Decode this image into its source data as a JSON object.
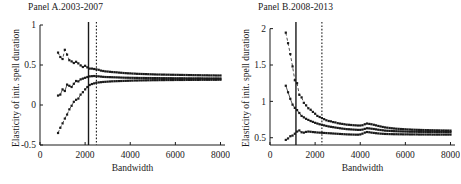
{
  "figure": {
    "background": "#ffffff",
    "ink_color": "#1a1a1a",
    "width": 461,
    "height": 184
  },
  "panels": [
    {
      "id": "panel-a",
      "title": "Panel A.2003-2007",
      "xlabel": "Bandwidth",
      "ylabel": "Elasticity of init. spell duration"
    },
    {
      "id": "panel-b",
      "title": "Panel B.2008-2013",
      "xlabel": "Bandwidth",
      "ylabel": "Elasticity of init. spell duration"
    }
  ],
  "chart_data": [
    {
      "type": "line",
      "title": "Panel A.2003-2007",
      "xlabel": "Bandwidth",
      "ylabel": "Elasticity of init. spell duration",
      "xlim": [
        0,
        8200
      ],
      "ylim": [
        -0.5,
        1.0
      ],
      "xticks": [
        0,
        2000,
        4000,
        6000,
        8000
      ],
      "xticklabels": [
        "0",
        "2000",
        "4000",
        "6000",
        "8000"
      ],
      "yticks": [
        -0.5,
        0,
        0.5,
        1
      ],
      "yticklabels": [
        "-0.5",
        "0",
        "0.5",
        "1"
      ],
      "grid": false,
      "legend": null,
      "marker": "square",
      "vlines": [
        {
          "x": 2150,
          "style": "solid",
          "label": "optimal bandwidth"
        },
        {
          "x": 2500,
          "style": "dotted",
          "label": "alternative bandwidth"
        }
      ],
      "x": [
        800,
        900,
        1000,
        1100,
        1200,
        1300,
        1400,
        1500,
        1600,
        1700,
        1800,
        1900,
        2000,
        2100,
        2200,
        2300,
        2400,
        2500,
        2600,
        2700,
        2800,
        2900,
        3000,
        3100,
        3200,
        3300,
        3400,
        3500,
        3600,
        3700,
        3800,
        3900,
        4000,
        4100,
        4200,
        4300,
        4400,
        4500,
        4600,
        4700,
        4800,
        4900,
        5000,
        5100,
        5200,
        5300,
        5400,
        5500,
        5600,
        5700,
        5800,
        5900,
        6000,
        6100,
        6200,
        6300,
        6400,
        6500,
        6600,
        6700,
        6800,
        6900,
        7000,
        7100,
        7200,
        7300,
        7400,
        7500,
        7600,
        7700,
        7800,
        7900,
        8000
      ],
      "series": [
        {
          "name": "upper confidence bound",
          "style": "dashed",
          "values": [
            0.655,
            0.6,
            0.575,
            0.69,
            0.63,
            0.56,
            0.545,
            0.525,
            0.54,
            0.52,
            0.495,
            0.475,
            0.49,
            0.47,
            0.455,
            0.455,
            0.45,
            0.445,
            0.44,
            0.43,
            0.425,
            0.42,
            0.418,
            0.415,
            0.412,
            0.41,
            0.408,
            0.405,
            0.403,
            0.4,
            0.398,
            0.396,
            0.395,
            0.393,
            0.392,
            0.39,
            0.389,
            0.388,
            0.387,
            0.386,
            0.385,
            0.384,
            0.383,
            0.382,
            0.381,
            0.381,
            0.38,
            0.38,
            0.379,
            0.379,
            0.378,
            0.378,
            0.377,
            0.377,
            0.376,
            0.376,
            0.375,
            0.375,
            0.374,
            0.374,
            0.373,
            0.373,
            0.372,
            0.372,
            0.371,
            0.371,
            0.371,
            0.37,
            0.37,
            0.37,
            0.369,
            0.369,
            0.369
          ]
        },
        {
          "name": "point estimate",
          "style": "solid",
          "values": [
            0.118,
            0.13,
            0.195,
            0.175,
            0.255,
            0.24,
            0.225,
            0.265,
            0.3,
            0.295,
            0.32,
            0.33,
            0.34,
            0.35,
            0.358,
            0.36,
            0.362,
            0.36,
            0.358,
            0.355,
            0.352,
            0.35,
            0.349,
            0.348,
            0.347,
            0.346,
            0.345,
            0.344,
            0.343,
            0.342,
            0.341,
            0.341,
            0.34,
            0.34,
            0.339,
            0.339,
            0.338,
            0.338,
            0.338,
            0.337,
            0.337,
            0.337,
            0.336,
            0.336,
            0.336,
            0.336,
            0.335,
            0.335,
            0.335,
            0.335,
            0.335,
            0.334,
            0.334,
            0.334,
            0.334,
            0.334,
            0.334,
            0.333,
            0.333,
            0.333,
            0.333,
            0.333,
            0.333,
            0.333,
            0.333,
            0.332,
            0.332,
            0.332,
            0.332,
            0.332,
            0.332,
            0.332,
            0.332
          ]
        },
        {
          "name": "lower confidence bound",
          "style": "dashed",
          "values": [
            -0.35,
            -0.285,
            -0.23,
            -0.17,
            -0.12,
            -0.055,
            -0.01,
            0.04,
            0.065,
            0.08,
            0.13,
            0.16,
            0.195,
            0.225,
            0.25,
            0.262,
            0.27,
            0.278,
            0.282,
            0.285,
            0.288,
            0.29,
            0.292,
            0.294,
            0.296,
            0.297,
            0.298,
            0.299,
            0.3,
            0.301,
            0.302,
            0.303,
            0.304,
            0.305,
            0.306,
            0.306,
            0.307,
            0.307,
            0.308,
            0.308,
            0.309,
            0.309,
            0.31,
            0.31,
            0.31,
            0.311,
            0.311,
            0.311,
            0.312,
            0.312,
            0.312,
            0.312,
            0.313,
            0.313,
            0.313,
            0.313,
            0.313,
            0.314,
            0.314,
            0.314,
            0.314,
            0.314,
            0.314,
            0.315,
            0.315,
            0.315,
            0.315,
            0.315,
            0.315,
            0.315,
            0.315,
            0.316,
            0.316
          ]
        }
      ]
    },
    {
      "type": "line",
      "title": "Panel B.2008-2013",
      "xlabel": "Bandwidth",
      "ylabel": "Elasticity of init. spell duration",
      "xlim": [
        0,
        8200
      ],
      "ylim": [
        0.4,
        2.05
      ],
      "xticks": [
        0,
        2000,
        4000,
        6000,
        8000
      ],
      "xticklabels": [
        "0",
        "2000",
        "4000",
        "6000",
        "8000"
      ],
      "yticks": [
        0.5,
        1,
        1.5,
        2
      ],
      "yticklabels": [
        "0.5",
        "1",
        "1.5",
        "2"
      ],
      "grid": false,
      "legend": null,
      "marker": "square",
      "vlines": [
        {
          "x": 1150,
          "style": "solid",
          "label": "optimal bandwidth"
        },
        {
          "x": 2300,
          "style": "dotted",
          "label": "alternative bandwidth"
        }
      ],
      "x": [
        700,
        800,
        900,
        1000,
        1100,
        1200,
        1300,
        1400,
        1500,
        1600,
        1700,
        1800,
        1900,
        2000,
        2100,
        2200,
        2300,
        2400,
        2500,
        2600,
        2700,
        2800,
        2900,
        3000,
        3100,
        3200,
        3300,
        3400,
        3500,
        3600,
        3700,
        3800,
        3900,
        4000,
        4100,
        4200,
        4300,
        4400,
        4500,
        4600,
        4700,
        4800,
        4900,
        5000,
        5100,
        5200,
        5300,
        5400,
        5500,
        5600,
        5700,
        5800,
        5900,
        6000,
        6100,
        6200,
        6300,
        6400,
        6500,
        6600,
        6700,
        6800,
        6900,
        7000,
        7100,
        7200,
        7300,
        7400,
        7500,
        7600,
        7700,
        7800,
        7900,
        8000
      ],
      "series": [
        {
          "name": "upper confidence bound",
          "style": "dashed",
          "values": [
            1.945,
            1.8,
            1.65,
            1.48,
            1.29,
            1.25,
            1.09,
            1.055,
            0.98,
            0.945,
            0.905,
            0.885,
            0.855,
            0.83,
            0.8,
            0.785,
            0.77,
            0.755,
            0.74,
            0.73,
            0.725,
            0.715,
            0.71,
            0.7,
            0.695,
            0.69,
            0.685,
            0.68,
            0.678,
            0.675,
            0.672,
            0.67,
            0.668,
            0.668,
            0.672,
            0.685,
            0.695,
            0.69,
            0.685,
            0.678,
            0.67,
            0.662,
            0.655,
            0.648,
            0.642,
            0.638,
            0.634,
            0.63,
            0.627,
            0.624,
            0.622,
            0.62,
            0.618,
            0.616,
            0.614,
            0.613,
            0.611,
            0.61,
            0.609,
            0.608,
            0.607,
            0.606,
            0.605,
            0.604,
            0.603,
            0.603,
            0.602,
            0.601,
            0.601,
            0.6,
            0.6,
            0.599,
            0.599,
            0.598
          ]
        },
        {
          "name": "point estimate",
          "style": "solid",
          "values": [
            1.215,
            1.125,
            1.035,
            0.955,
            0.91,
            0.88,
            0.84,
            0.8,
            0.78,
            0.76,
            0.745,
            0.73,
            0.718,
            0.705,
            0.695,
            0.685,
            0.678,
            0.67,
            0.662,
            0.655,
            0.65,
            0.645,
            0.64,
            0.635,
            0.63,
            0.626,
            0.622,
            0.618,
            0.616,
            0.614,
            0.612,
            0.61,
            0.608,
            0.608,
            0.612,
            0.622,
            0.63,
            0.628,
            0.624,
            0.62,
            0.615,
            0.61,
            0.606,
            0.602,
            0.598,
            0.596,
            0.594,
            0.592,
            0.59,
            0.589,
            0.588,
            0.587,
            0.586,
            0.585,
            0.584,
            0.583,
            0.583,
            0.582,
            0.582,
            0.581,
            0.581,
            0.58,
            0.58,
            0.58,
            0.579,
            0.579,
            0.579,
            0.578,
            0.578,
            0.578,
            0.578,
            0.578,
            0.577,
            0.577
          ]
        },
        {
          "name": "lower confidence bound",
          "style": "dashed",
          "values": [
            0.47,
            0.49,
            0.52,
            0.53,
            0.555,
            0.585,
            0.6,
            0.575,
            0.57,
            0.58,
            0.585,
            0.582,
            0.578,
            0.575,
            0.572,
            0.57,
            0.568,
            0.566,
            0.564,
            0.562,
            0.56,
            0.558,
            0.556,
            0.554,
            0.552,
            0.55,
            0.548,
            0.546,
            0.545,
            0.544,
            0.543,
            0.542,
            0.542,
            0.545,
            0.556,
            0.57,
            0.578,
            0.575,
            0.57,
            0.566,
            0.562,
            0.559,
            0.556,
            0.554,
            0.552,
            0.551,
            0.55,
            0.549,
            0.548,
            0.548,
            0.547,
            0.547,
            0.546,
            0.546,
            0.546,
            0.545,
            0.545,
            0.545,
            0.545,
            0.544,
            0.544,
            0.544,
            0.544,
            0.544,
            0.544,
            0.543,
            0.543,
            0.543,
            0.543,
            0.543,
            0.543,
            0.543,
            0.543,
            0.543
          ]
        }
      ]
    }
  ]
}
